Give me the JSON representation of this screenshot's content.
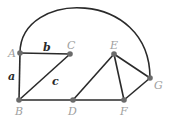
{
  "diagram": {
    "type": "graph",
    "nodes": [
      {
        "id": "A",
        "label": "A",
        "x": 20,
        "y": 53,
        "lx": 8,
        "ly": 57
      },
      {
        "id": "B",
        "label": "B",
        "x": 19,
        "y": 100,
        "lx": 15,
        "ly": 115
      },
      {
        "id": "C",
        "label": "C",
        "x": 70,
        "y": 54,
        "lx": 67,
        "ly": 49
      },
      {
        "id": "D",
        "label": "D",
        "x": 73,
        "y": 100,
        "lx": 68,
        "ly": 115
      },
      {
        "id": "E",
        "label": "E",
        "x": 114,
        "y": 54,
        "lx": 110,
        "ly": 49
      },
      {
        "id": "F",
        "label": "F",
        "x": 124,
        "y": 100,
        "lx": 120,
        "ly": 115
      },
      {
        "id": "G",
        "label": "G",
        "x": 150,
        "y": 78,
        "lx": 154,
        "ly": 89
      }
    ],
    "edges": [
      {
        "from": "A",
        "to": "C",
        "label": "b"
      },
      {
        "from": "A",
        "to": "B",
        "label": "a"
      },
      {
        "from": "B",
        "to": "C",
        "label": "c"
      },
      {
        "from": "B",
        "to": "D",
        "label": ""
      },
      {
        "from": "D",
        "to": "F",
        "label": ""
      },
      {
        "from": "D",
        "to": "E",
        "label": ""
      },
      {
        "from": "E",
        "to": "F",
        "label": ""
      },
      {
        "from": "E",
        "to": "G",
        "label": ""
      },
      {
        "from": "F",
        "to": "G",
        "label": ""
      },
      {
        "from": "A",
        "to": "G",
        "label": "",
        "curved": true
      }
    ],
    "edge_labels": [
      {
        "text": "b",
        "x": 43,
        "y": 51
      },
      {
        "text": "a",
        "x": 8,
        "y": 80
      },
      {
        "text": "c",
        "x": 52,
        "y": 85
      }
    ]
  }
}
